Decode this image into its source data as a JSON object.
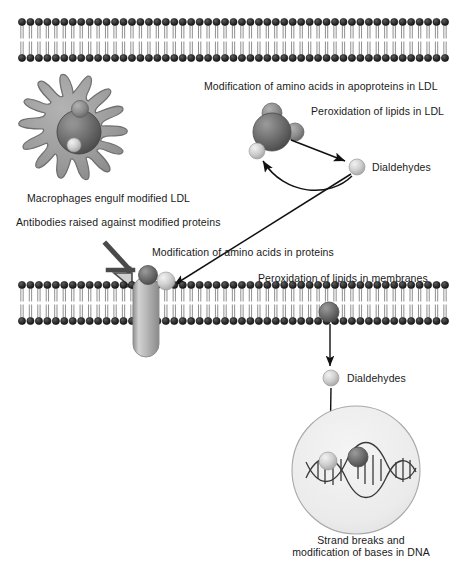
{
  "figure": {
    "background": "#ffffff"
  },
  "colors": {
    "membrane_head": "#2b2b2b",
    "membrane_tail": "#555555",
    "ldl_dark": "#6e6e6e",
    "ldl_mid": "#8a8a8a",
    "sphere_light": "#c9c9c9",
    "macrophage_body": "#9a9a9a",
    "macrophage_outline": "#6a6a6a",
    "protein_capsule": "#b8b8b8",
    "antibody": "#4a4a4a",
    "nucleus_fill": "#ededed",
    "nucleus_outline": "#9a9a9a",
    "arrow": "#111111",
    "text": "#1a1a1a"
  },
  "labels": {
    "modification_apoproteins": "Modification of amino acids in apoproteins in LDL",
    "peroxidation_lipids_ldl": "Peroxidation of lipids in LDL",
    "dialdehydes_top": "Dialdehydes",
    "macrophages": "Macrophages engulf modified LDL",
    "antibodies": "Antibodies raised against modified proteins",
    "modification_proteins": "Modification of amino acids in proteins",
    "peroxidation_membranes": "Peroxidation of lipids in membranes",
    "dialdehydes_bottom": "Dialdehydes",
    "dna_caption_line1": "Strand breaks and",
    "dna_caption_line2": "modification of bases in DNA"
  },
  "structures": {
    "membrane_top": {
      "name": "lipid-bilayer-top",
      "x": 22,
      "y": 22,
      "width": 423,
      "height": 36,
      "lipid_count": 51
    },
    "membrane_bottom": {
      "name": "lipid-bilayer-bottom",
      "x": 22,
      "y": 285,
      "width": 423,
      "height": 36,
      "lipid_count": 51
    },
    "macrophage": {
      "name": "macrophage-cell",
      "cx": 73,
      "cy": 133,
      "radius": 40
    },
    "ldl_particle_top": {
      "name": "ldl-particle",
      "cx": 274,
      "cy": 131,
      "radius": 19
    },
    "dialdehyde_sphere_top": {
      "name": "dialdehyde-sphere-top",
      "cx": 357,
      "cy": 167,
      "radius": 8
    },
    "membrane_protein": {
      "name": "transmembrane-protein",
      "cx": 146,
      "cy": 310,
      "width": 26,
      "height": 80
    },
    "antibody": {
      "name": "antibody-y-shape",
      "x": 104,
      "y": 243,
      "width": 34,
      "height": 42
    },
    "membrane_lipid_sphere": {
      "name": "peroxidized-lipid-sphere",
      "cx": 329,
      "cy": 312,
      "radius": 10
    },
    "dialdehyde_sphere_bottom": {
      "name": "dialdehyde-sphere-bottom",
      "cx": 331,
      "cy": 378,
      "radius": 8
    },
    "nucleus": {
      "name": "cell-nucleus",
      "cx": 356,
      "cy": 470,
      "radius": 64
    },
    "dna_helix": {
      "name": "dna-double-helix",
      "cx": 356,
      "cy": 470,
      "width": 96
    },
    "dna_sphere_light": {
      "name": "dna-adduct-sphere-light",
      "cx": 328,
      "cy": 461,
      "radius": 9
    },
    "dna_sphere_dark": {
      "name": "dna-adduct-sphere-dark",
      "cx": 358,
      "cy": 457,
      "radius": 10
    }
  },
  "arrows": [
    {
      "name": "arrow-ldl-to-dialdehyde",
      "from": [
        292,
        139
      ],
      "to": [
        348,
        162
      ],
      "style": "straight"
    },
    {
      "name": "arrow-dialdehyde-to-ldl",
      "from": [
        352,
        174
      ],
      "to": [
        262,
        150
      ],
      "style": "curved"
    },
    {
      "name": "arrow-dialdehyde-to-membrane-protein",
      "from": [
        352,
        174
      ],
      "to": [
        170,
        287
      ],
      "style": "straight"
    },
    {
      "name": "arrow-lipid-to-dialdehyde",
      "from": [
        330,
        324
      ],
      "to": [
        330,
        368
      ],
      "style": "straight"
    },
    {
      "name": "arrow-dialdehyde-to-dna",
      "from": [
        331,
        388
      ],
      "to": [
        330,
        452
      ],
      "style": "straight"
    }
  ]
}
